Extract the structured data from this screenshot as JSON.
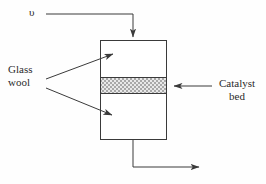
{
  "figure": {
    "background_color": "#fefefe",
    "line_color": "#3a3a3a",
    "text_color": "#2b2b2b"
  },
  "labels": {
    "flow_symbol": "υ",
    "glass_wool": "Glass\nwool",
    "glass_wool_line1": "Glass",
    "glass_wool_line2": "wool",
    "catalyst_bed": "Catalyst\nbed",
    "catalyst_bed_line1": "Catalyst",
    "catalyst_bed_line2": "bed"
  },
  "vessel": {
    "name": "reactor-vessel",
    "x": 100,
    "y": 40,
    "width": 66,
    "height": 100,
    "stroke": "#3a3a3a",
    "fill": "#ffffff"
  },
  "catalyst_bed_band": {
    "name": "catalyst-bed-band",
    "x": 100,
    "y": 77,
    "width": 66,
    "height": 16,
    "fill_pattern": "checkerboard-gray",
    "fill_color": "#b5b5b5",
    "stroke": "#3a3a3a"
  },
  "flows": {
    "inlet": {
      "name": "inlet-flow-arrow",
      "path": "M 46,14 L 133,14 L 133,38",
      "arrow_at": [
        133,
        40
      ],
      "direction": "down-into-vessel-top"
    },
    "outlet": {
      "name": "outlet-flow-arrow",
      "path": "M 133,140 L 133,167 L 202,167",
      "arrow_at": [
        206,
        167
      ],
      "direction": "right"
    }
  },
  "leaders": {
    "glass_wool_upper": {
      "name": "glass-wool-upper-leader",
      "path": "M 46,79 L 115,53",
      "arrow_at": [
        119,
        51
      ]
    },
    "glass_wool_lower": {
      "name": "glass-wool-lower-leader",
      "path": "M 46,88 L 114,116",
      "arrow_at": [
        118,
        118
      ]
    },
    "catalyst_bed": {
      "name": "catalyst-bed-leader",
      "path": "M 212,86 L 172,86",
      "arrow_at": [
        167,
        86
      ]
    }
  }
}
